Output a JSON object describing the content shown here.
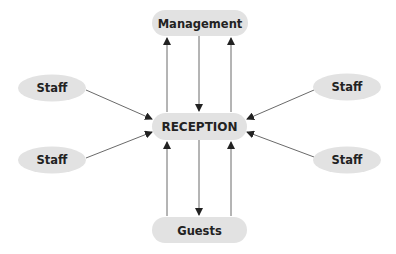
{
  "diagram": {
    "type": "flow",
    "colors": {
      "node_fill": "#e2e2e2",
      "text": "#222222",
      "edge": "#6a6a6a",
      "arrowhead": "#222222",
      "background": "#ffffff"
    },
    "nodes": {
      "management": {
        "label": "Management",
        "shape": "pill"
      },
      "reception": {
        "label": "RECEPTION",
        "shape": "pill"
      },
      "guests": {
        "label": "Guests",
        "shape": "pill"
      },
      "staff_top_left": {
        "label": "Staff",
        "shape": "ellipse"
      },
      "staff_bottom_left": {
        "label": "Staff",
        "shape": "ellipse"
      },
      "staff_top_right": {
        "label": "Staff",
        "shape": "ellipse"
      },
      "staff_bottom_right": {
        "label": "Staff",
        "shape": "ellipse"
      }
    },
    "edges": [
      {
        "from": "reception",
        "to": "management"
      },
      {
        "from": "management",
        "to": "reception"
      },
      {
        "from": "reception",
        "to": "management"
      },
      {
        "from": "guests",
        "to": "reception"
      },
      {
        "from": "reception",
        "to": "guests"
      },
      {
        "from": "guests",
        "to": "reception"
      },
      {
        "from": "staff_top_left",
        "to": "reception"
      },
      {
        "from": "staff_bottom_left",
        "to": "reception"
      },
      {
        "from": "staff_top_right",
        "to": "reception"
      },
      {
        "from": "staff_bottom_right",
        "to": "reception"
      }
    ]
  }
}
